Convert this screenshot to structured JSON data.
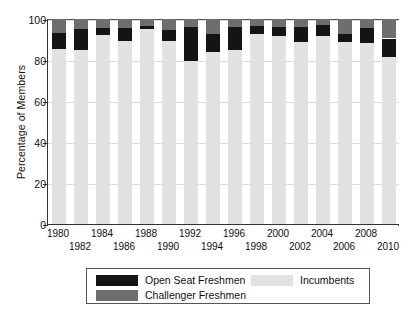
{
  "chart_data": {
    "type": "bar",
    "stacked": true,
    "title": "",
    "xlabel": "",
    "ylabel": "Percentage of Members",
    "ylim": [
      0,
      100
    ],
    "yticks": [
      0,
      20,
      40,
      60,
      80,
      100
    ],
    "ytick_labels": [
      "0",
      "20",
      "40",
      "60",
      "80",
      "100"
    ],
    "grid": true,
    "legend_position": "bottom",
    "categories": [
      "1980",
      "1982",
      "1984",
      "1986",
      "1988",
      "1990",
      "1992",
      "1994",
      "1996",
      "1998",
      "2000",
      "2002",
      "2004",
      "2006",
      "2008",
      "2010"
    ],
    "series": [
      {
        "name": "Incumbents",
        "color": "#e2e2e2",
        "values": [
          85.5,
          85.0,
          92.0,
          89.5,
          95.0,
          89.5,
          79.5,
          84.0,
          85.0,
          92.5,
          91.5,
          89.0,
          91.5,
          89.0,
          88.5,
          81.5
        ]
      },
      {
        "name": "Open Seat Freshmen",
        "color": "#141414",
        "values": [
          7.5,
          10.0,
          3.5,
          6.0,
          1.5,
          5.0,
          16.5,
          8.5,
          11.0,
          4.0,
          4.5,
          7.0,
          5.5,
          3.5,
          7.0,
          9.0
        ]
      },
      {
        "name": "Challenger Freshmen",
        "color": "#6e6e6e",
        "values": [
          7.0,
          5.0,
          4.5,
          4.5,
          3.5,
          5.5,
          4.0,
          7.5,
          4.0,
          3.5,
          4.0,
          4.0,
          3.0,
          7.5,
          4.5,
          9.5
        ]
      }
    ]
  },
  "legend": {
    "items": [
      {
        "label": "Open Seat Freshmen",
        "swatch": "open"
      },
      {
        "label": "Challenger Freshmen",
        "swatch": "chal"
      },
      {
        "label": "Incumbents",
        "swatch": "inc"
      }
    ]
  }
}
